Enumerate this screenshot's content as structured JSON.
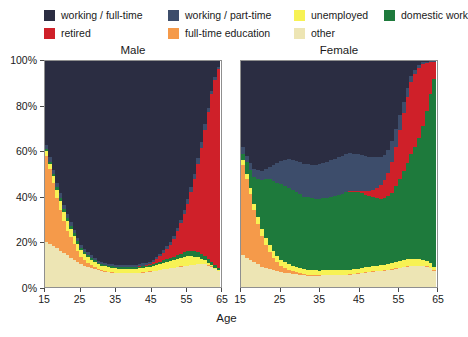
{
  "legend": {
    "items": [
      {
        "label": "working / full-time",
        "color": "#2b2d42",
        "key": "full_time"
      },
      {
        "label": "working / part-time",
        "color": "#3d4d6b",
        "key": "part_time"
      },
      {
        "label": "unemployed",
        "color": "#f7f254",
        "key": "unemployed"
      },
      {
        "label": "domestic work",
        "color": "#1e7a3c",
        "key": "domestic"
      },
      {
        "label": "retired",
        "color": "#cf2029",
        "key": "retired"
      },
      {
        "label": "full-time education",
        "color": "#f59a4a",
        "key": "education"
      },
      {
        "label": "other",
        "color": "#ede5b4",
        "key": "other"
      }
    ]
  },
  "panels": [
    {
      "name": "male",
      "title": "Male"
    },
    {
      "name": "female",
      "title": "Female"
    }
  ],
  "axes": {
    "y_label": "",
    "y_ticks": [
      "0%",
      "20%",
      "40%",
      "60%",
      "80%",
      "100%"
    ],
    "x_title": "Age",
    "x_ticks": [
      "15",
      "25",
      "35",
      "45",
      "55",
      "65"
    ]
  },
  "chart_data": {
    "type": "area",
    "title": "",
    "subtitle": "",
    "xlabel": "Age",
    "ylabel": "",
    "xlim": [
      15,
      65
    ],
    "ylim": [
      0,
      100
    ],
    "stacked": true,
    "normalized_percent": true,
    "grid": false,
    "legend_position": "top",
    "series_order": [
      "other",
      "education",
      "unemployed",
      "domestic",
      "retired",
      "part_time",
      "full_time"
    ],
    "series_colors": {
      "full_time": "#2b2d42",
      "part_time": "#3d4d6b",
      "unemployed": "#f7f254",
      "domestic": "#1e7a3c",
      "retired": "#cf2029",
      "education": "#f59a4a",
      "other": "#ede5b4"
    },
    "series_labels": {
      "full_time": "working / full-time",
      "part_time": "working / part-time",
      "unemployed": "unemployed",
      "domestic": "domestic work",
      "retired": "retired",
      "education": "full-time education",
      "other": "other"
    },
    "x": [
      15,
      16,
      17,
      18,
      19,
      20,
      21,
      22,
      23,
      24,
      25,
      26,
      27,
      28,
      29,
      30,
      31,
      32,
      33,
      34,
      35,
      36,
      37,
      38,
      39,
      40,
      41,
      42,
      43,
      44,
      45,
      46,
      47,
      48,
      49,
      50,
      51,
      52,
      53,
      54,
      55,
      56,
      57,
      58,
      59,
      60,
      61,
      62,
      63,
      64,
      65
    ],
    "panels": {
      "male": {
        "label": "Male",
        "series": [
          {
            "name": "other",
            "values": [
              20,
              19,
              18,
              17,
              16,
              15,
              14,
              13,
              12,
              11,
              10,
              9.5,
              9,
              8.5,
              8,
              7.5,
              7,
              6.8,
              6.6,
              6.4,
              6.2,
              6,
              6,
              6,
              6,
              6,
              6,
              6.2,
              6.4,
              6.6,
              6.8,
              7,
              7.2,
              7.5,
              7.8,
              8,
              8.2,
              8.5,
              8.8,
              9,
              9.2,
              9.4,
              9.6,
              9.8,
              10,
              10,
              10,
              9.5,
              9,
              8,
              7
            ]
          },
          {
            "name": "education",
            "values": [
              38,
              33,
              28,
              22,
              18,
              14,
              11,
              9,
              7,
              5,
              3.5,
              2.5,
              1.8,
              1.2,
              0.8,
              0.5,
              0.4,
              0.3,
              0.2,
              0.2,
              0.1,
              0.1,
              0.1,
              0.1,
              0.1,
              0.1,
              0.1,
              0.1,
              0.1,
              0.1,
              0.1,
              0.1,
              0.1,
              0.1,
              0.1,
              0.1,
              0.1,
              0.1,
              0.1,
              0.1,
              0.1,
              0.1,
              0.1,
              0.1,
              0.1,
              0.1,
              0.1,
              0.1,
              0.1,
              0.1,
              0.1
            ]
          },
          {
            "name": "unemployed",
            "values": [
              2,
              2.5,
              3,
              3.5,
              4,
              4,
              4,
              3.8,
              3.5,
              3.2,
              3,
              2.8,
              2.6,
              2.4,
              2.2,
              2,
              2,
              2,
              2,
              2,
              2,
              2,
              2,
              2,
              2,
              2,
              2,
              2,
              2,
              2,
              2,
              2.2,
              2.4,
              2.6,
              2.8,
              3,
              3.2,
              3.4,
              3.6,
              3.8,
              4,
              4.2,
              4,
              3.6,
              3,
              2.4,
              1.8,
              1.2,
              0.8,
              0.5,
              0.4
            ]
          },
          {
            "name": "domestic",
            "values": [
              1,
              1,
              1,
              1.2,
              1.4,
              1.5,
              1.5,
              1.4,
              1.2,
              1,
              0.9,
              0.8,
              0.8,
              0.7,
              0.7,
              0.6,
              0.6,
              0.6,
              0.6,
              0.6,
              0.6,
              0.6,
              0.6,
              0.6,
              0.6,
              0.6,
              0.6,
              0.6,
              0.7,
              0.7,
              0.8,
              0.8,
              0.9,
              1,
              1.1,
              1.2,
              1.3,
              1.4,
              1.6,
              1.8,
              2,
              2.2,
              2.4,
              2.4,
              2.2,
              2,
              1.8,
              1.6,
              1.4,
              1.2,
              1
            ]
          },
          {
            "name": "retired",
            "values": [
              0,
              0,
              0,
              0,
              0,
              0,
              0,
              0,
              0,
              0,
              0,
              0,
              0,
              0,
              0,
              0,
              0,
              0,
              0,
              0,
              0,
              0,
              0,
              0,
              0,
              0,
              0.1,
              0.2,
              0.3,
              0.4,
              0.6,
              1,
              1.6,
              2.4,
              3.4,
              4.6,
              6,
              8,
              10.5,
              13.5,
              17,
              21,
              26,
              32,
              39,
              47,
              56,
              65,
              74,
              82,
              88
            ]
          },
          {
            "name": "part_time",
            "values": [
              2,
              2,
              2,
              2,
              2,
              2,
              2,
              1.8,
              1.6,
              1.5,
              1.4,
              1.3,
              1.2,
              1.2,
              1.1,
              1.1,
              1,
              1,
              1,
              1,
              1,
              1,
              1,
              1,
              1,
              1,
              1,
              1,
              1,
              1,
              1,
              1,
              1.1,
              1.1,
              1.2,
              1.2,
              1.3,
              1.4,
              1.5,
              1.6,
              1.8,
              2,
              2.2,
              2.4,
              2.6,
              2.6,
              2.4,
              2,
              1.6,
              1.2,
              1
            ]
          },
          {
            "name": "full_time",
            "values": [
              37,
              42.5,
              48,
              53.3,
              58.6,
              63.5,
              67.5,
              71,
              74.5,
              78.3,
              81.2,
              83.1,
              84.6,
              85.7,
              86.8,
              88.3,
              89,
              89.3,
              89.6,
              89.8,
              90.1,
              90.3,
              90.3,
              90.3,
              90.3,
              90.3,
              90.2,
              89.9,
              89.5,
              89.2,
              88.6,
              87.9,
              86.7,
              85.3,
              83.6,
              81.9,
              79.9,
              77.2,
              73.9,
              70.2,
              65.7,
              61.1,
              55.7,
              49.9,
              43.1,
              35.9,
              27.9,
              20.6,
              13.1,
              7.1,
              2.5
            ]
          }
        ]
      },
      "female": {
        "label": "Female",
        "series": [
          {
            "name": "other",
            "values": [
              14,
              13,
              12,
              11,
              10,
              9,
              8.5,
              8,
              7.5,
              7,
              6.5,
              6.2,
              6,
              5.8,
              5.6,
              5.4,
              5.2,
              5,
              5,
              5,
              5,
              5,
              5,
              5,
              5,
              5,
              5,
              5.2,
              5.4,
              5.6,
              5.8,
              6,
              6.2,
              6.4,
              6.6,
              6.8,
              7,
              7.2,
              7.4,
              7.6,
              7.8,
              8,
              8.2,
              8.4,
              8.6,
              8.8,
              9,
              8.8,
              8.4,
              7.6,
              6.5
            ]
          },
          {
            "name": "education",
            "values": [
              40,
              35,
              29,
              23,
              18,
              13.5,
              10,
              7.5,
              5.5,
              4,
              3,
              2.2,
              1.6,
              1.2,
              0.9,
              0.7,
              0.5,
              0.4,
              0.3,
              0.3,
              0.2,
              0.2,
              0.2,
              0.2,
              0.2,
              0.2,
              0.2,
              0.2,
              0.2,
              0.2,
              0.2,
              0.2,
              0.2,
              0.2,
              0.2,
              0.2,
              0.2,
              0.2,
              0.2,
              0.2,
              0.2,
              0.2,
              0.2,
              0.2,
              0.2,
              0.2,
              0.2,
              0.2,
              0.2,
              0.2,
              0.2
            ]
          },
          {
            "name": "domestic",
            "values": [
              3,
              5,
              8,
              12,
              17,
              22,
              26,
              29,
              31,
              32.5,
              33.5,
              34,
              34,
              33.8,
              33.4,
              32.8,
              32.2,
              31.8,
              31.5,
              31.3,
              31.2,
              31.2,
              31.4,
              31.7,
              32.2,
              32.8,
              33.3,
              33.6,
              33.8,
              33.6,
              33.2,
              32.5,
              31.6,
              30.7,
              29.9,
              29.4,
              29.2,
              29.4,
              30,
              31,
              32.5,
              34.5,
              37,
              40,
              43.5,
              47.5,
              52,
              57,
              62.5,
              68,
              74
            ]
          },
          {
            "name": "unemployed",
            "values": [
              2,
              2.2,
              2.5,
              2.8,
              3,
              3,
              3,
              2.9,
              2.8,
              2.7,
              2.6,
              2.5,
              2.4,
              2.3,
              2.2,
              2.2,
              2.1,
              2.1,
              2,
              2,
              2,
              2,
              2,
              2,
              2,
              2,
              2,
              2,
              2,
              2,
              2,
              2,
              2.1,
              2.1,
              2.2,
              2.2,
              2.3,
              2.4,
              2.5,
              2.6,
              2.7,
              2.8,
              2.9,
              3,
              3,
              3,
              2.9,
              2.6,
              2.2,
              1.8,
              1.4
            ]
          },
          {
            "name": "retired",
            "values": [
              0,
              0,
              0,
              0,
              0,
              0,
              0,
              0,
              0,
              0,
              0,
              0,
              0,
              0,
              0,
              0,
              0,
              0,
              0,
              0,
              0,
              0,
              0,
              0,
              0,
              0,
              0,
              0.1,
              0.2,
              0.3,
              0.5,
              0.9,
              1.5,
              2.3,
              3.3,
              4.5,
              6,
              8,
              10.5,
              13.5,
              17,
              20.5,
              24,
              27.5,
              30,
              31,
              30,
              26,
              20,
              13,
              7
            ]
          },
          {
            "name": "part_time",
            "values": [
              3,
              3,
              3.2,
              3.4,
              3.6,
              4,
              4.5,
              5.5,
              7,
              8.5,
              10,
              11.5,
              12.5,
              13.2,
              13.8,
              14.2,
              14.5,
              14.7,
              14.8,
              15,
              15.2,
              15.5,
              15.8,
              16,
              16.2,
              16.4,
              16.5,
              16.5,
              16.4,
              16.2,
              16,
              15.6,
              15.2,
              14.6,
              14,
              13.2,
              12.4,
              11.4,
              10.2,
              9,
              7.6,
              6.2,
              4.8,
              3.6,
              2.6,
              1.8,
              1.2,
              0.8,
              0.5,
              0.3,
              0.2
            ]
          },
          {
            "name": "full_time",
            "values": [
              38,
              41.8,
              44.8,
              47.8,
              48.4,
              48.5,
              47.5,
              46.6,
              46.2,
              45.3,
              44.4,
              43.6,
              43.5,
              43.7,
              44.1,
              44.7,
              45.5,
              45,
              45.4,
              45.4,
              45.2,
              44.1,
              43.6,
              43.1,
              42.4,
              41.6,
              41,
              40.4,
              40,
              40.1,
              40.3,
              40.8,
              41.2,
              41.7,
              41.8,
              41.7,
              41.9,
              41.4,
              39.2,
              35.1,
              29.2,
              22.8,
              16.9,
              11.3,
              6.1,
              3.7,
              1.7,
              0.6,
              0.2,
              0.1,
              0.1
            ]
          }
        ]
      }
    }
  }
}
